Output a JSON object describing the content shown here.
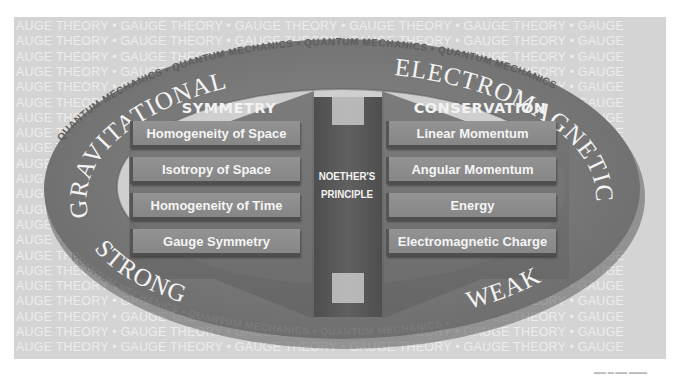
{
  "background": {
    "repeated_text": "AUGE THEORY  •  GAUGE THEORY  •  GAUGE THEORY  •  GAUGE THEORY  •  GAUGE THEORY  •  GAUGE",
    "line_count": 22
  },
  "ring": {
    "forces": {
      "top_left": "GRAVITATIONAL",
      "top_right": "ELECTROMAGNETIC",
      "bottom_left": "STRONG",
      "bottom_right": "WEAK"
    },
    "outer_text": "QUANTUM MECHANICS • QUANTUM MECHANICS • QUANTUM MECHANICS • QUANTUM MECHANICS • QUANTUM MECHANICS • QUANTUM MECHANICS •"
  },
  "symmetry_panel": {
    "heading": "SYMMETRY",
    "items": [
      "Homogeneity of Space",
      "Isotropy of Space",
      "Homogeneity of Time",
      "Gauge Symmetry"
    ]
  },
  "conservation_panel": {
    "heading": "CONSERVATION",
    "items": [
      "Linear Momentum",
      "Angular Momentum",
      "Energy",
      "Electromagnetic Charge"
    ]
  },
  "center": {
    "line1": "NOETHER'S",
    "line2": "PRINCIPLE"
  },
  "colors": {
    "background": "#d4d4d4",
    "ring": "#7d7d7d",
    "panel": "#6f6f6f",
    "item": "#8e8e8e",
    "center_column": "#5a5a5a",
    "text_light": "#f4f4f4"
  }
}
